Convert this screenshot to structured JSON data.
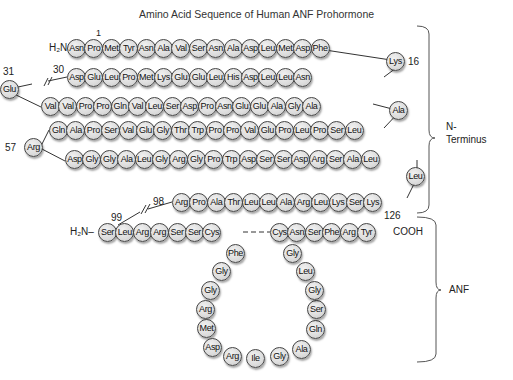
{
  "title": "Amino Acid Sequence of Human ANF Prohormone",
  "labels": {
    "h2n_top": "H₂N–",
    "h2n_bottom": "H₂N–",
    "cooh": "COOH",
    "n1": "1",
    "n16": "16",
    "n30": "30",
    "n31": "31",
    "n57": "57",
    "n98": "98",
    "n99": "99",
    "n126": "126",
    "n_terminus": "N-\nTerminus",
    "n_terminus_line1": "N-",
    "n_terminus_line2": "Terminus",
    "anf": "ANF"
  },
  "rows": {
    "row1": [
      "Asn",
      "Pro",
      "Met",
      "Tyr",
      "Asn",
      "Ala",
      "Val",
      "Ser",
      "Asn",
      "Ala",
      "Asp",
      "Leu",
      "Met",
      "Asp",
      "Phe"
    ],
    "lys16": "Lys",
    "row2": [
      "Asp",
      "Glu",
      "Leu",
      "Pro",
      "Met",
      "Lys",
      "Glu",
      "Glu",
      "Leu",
      "His",
      "Asp",
      "Leu",
      "Leu",
      "Asn"
    ],
    "glu31": "Glu",
    "row3": [
      "Val",
      "Val",
      "Pro",
      "Pro",
      "Gln",
      "Val",
      "Leu",
      "Ser",
      "Asp",
      "Pro",
      "Asn",
      "Glu",
      "Glu",
      "Ala",
      "Gly",
      "Ala"
    ],
    "ala_turn": "Ala",
    "row4": [
      "Gln",
      "Ala",
      "Pro",
      "Ser",
      "Val",
      "Glu",
      "Gly",
      "Thr",
      "Trp",
      "Pro",
      "Pro",
      "Val",
      "Glu",
      "Pro",
      "Leu",
      "Pro",
      "Ser",
      "Leu"
    ],
    "arg57": "Arg",
    "row5": [
      "Asp",
      "Gly",
      "Gly",
      "Ala",
      "Leu",
      "Gly",
      "Arg",
      "Gly",
      "Pro",
      "Trp",
      "Asp",
      "Ser",
      "Ser",
      "Asp",
      "Arg",
      "Ser",
      "Ala",
      "Leu"
    ],
    "leu_turn": "Leu",
    "row6": [
      "Arg",
      "Pro",
      "Ala",
      "Thr",
      "Leu",
      "Leu",
      "Ala",
      "Arg",
      "Leu",
      "Lys",
      "Ser",
      "Lys"
    ],
    "anf_left": [
      "Ser",
      "Leu",
      "Arg",
      "Arg",
      "Ser",
      "Ser",
      "Cys"
    ],
    "anf_right": [
      "Cys",
      "Asn",
      "Ser",
      "Phe",
      "Arg",
      "Tyr"
    ],
    "loop": [
      "Phe",
      "Gly",
      "Gly",
      "Arg",
      "Met",
      "Asp",
      "Arg",
      "Ile",
      "Gly",
      "Ala",
      "Gln",
      "Ser",
      "Gly",
      "Leu",
      "Gly"
    ]
  },
  "colors": {
    "residue_fill": "#dcdcdc",
    "residue_border": "#444444",
    "bracket": "#555555"
  }
}
